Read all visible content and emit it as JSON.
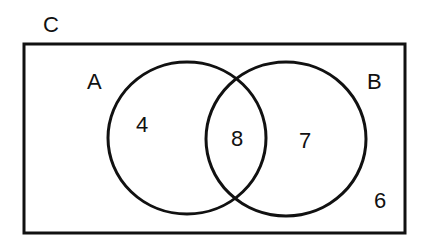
{
  "diagram": {
    "type": "venn",
    "universe_label": "C",
    "sets": [
      {
        "label": "A",
        "only_value": "4"
      },
      {
        "label": "B",
        "only_value": "7"
      }
    ],
    "intersection_value": "8",
    "outside_value": "6"
  }
}
